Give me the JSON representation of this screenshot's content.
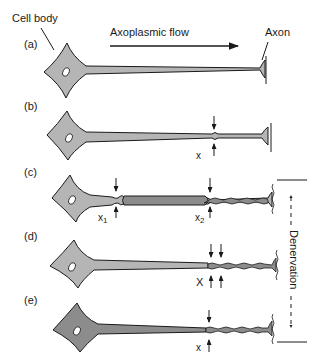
{
  "labels": {
    "cell_body": "Cell body",
    "axoplasmic_flow": "Axoplasmic flow",
    "axon": "Axon",
    "denervation": "Denervation"
  },
  "panels": [
    {
      "id": "a",
      "label": "(a)"
    },
    {
      "id": "b",
      "label": "(b)",
      "lesion": "x"
    },
    {
      "id": "c",
      "label": "(c)",
      "lesion_1": "x",
      "lesion_1_sub": "1",
      "lesion_2": "x",
      "lesion_2_sub": "2"
    },
    {
      "id": "d",
      "label": "(d)",
      "lesion": "X"
    },
    {
      "id": "e",
      "label": "(e)",
      "lesion": "x"
    }
  ],
  "colors": {
    "cell_fill_light": "#b5b5b5",
    "cell_fill_dark": "#8c8c8c",
    "outline": "#1a1a1a"
  }
}
